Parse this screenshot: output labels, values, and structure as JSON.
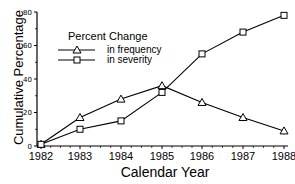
{
  "chart_data": {
    "type": "line",
    "title": "",
    "xlabel": "Calendar Year",
    "ylabel": "Cumulative Percentage",
    "x": [
      "1982",
      "1983",
      "1984",
      "1985",
      "1986",
      "1987",
      "1988"
    ],
    "y_ticks": [
      0,
      20,
      40,
      60,
      80
    ],
    "ylim": [
      0,
      80
    ],
    "grid": false,
    "legend": {
      "title": "Percent Change",
      "position": "upper left"
    },
    "series": [
      {
        "name": "in frequency",
        "marker": "triangle",
        "values": [
          1,
          17,
          28,
          36,
          26,
          17,
          9
        ]
      },
      {
        "name": "in severity",
        "marker": "square",
        "values": [
          1,
          10,
          15,
          32,
          55,
          68,
          78
        ]
      }
    ]
  },
  "labels": {
    "ylabel": "Cumulative Percentage",
    "xlabel": "Calendar Year",
    "legend_title": "Percent Change",
    "legend_freq": "in frequency",
    "legend_sev": "in severity"
  }
}
